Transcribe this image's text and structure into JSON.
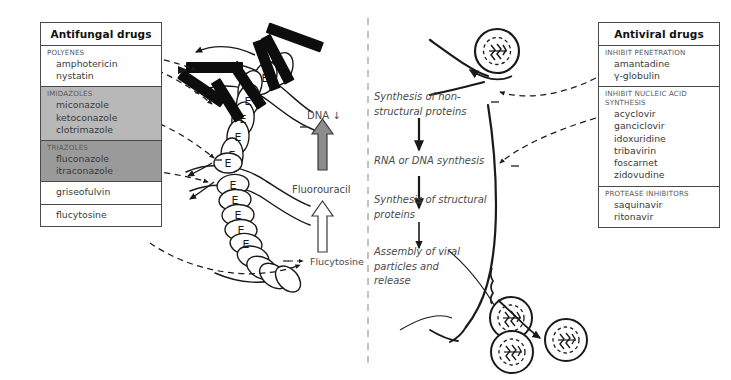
{
  "antifungal_panel": {
    "title": "Antifungal drugs",
    "groups": [
      {
        "heading": "POLYENES",
        "shade": "none",
        "drugs": [
          "amphotericin",
          "nystatin"
        ]
      },
      {
        "heading": "IMIDAZOLES",
        "shade": "light",
        "drugs": [
          "miconazole",
          "ketoconazole",
          "clotrimazole"
        ]
      },
      {
        "heading": "TRIAZOLES",
        "shade": "dark",
        "drugs": [
          "fluconazole",
          "itraconazole"
        ]
      },
      {
        "heading": "",
        "shade": "none",
        "drugs": [
          "griseofulvin"
        ]
      },
      {
        "heading": "",
        "shade": "none",
        "drugs": [
          "flucytosine"
        ]
      }
    ]
  },
  "antiviral_panel": {
    "title": "Antiviral drugs",
    "groups": [
      {
        "heading": "INHIBIT PENETRATION",
        "shade": "none",
        "drugs": [
          "amantadine",
          "γ-globulin"
        ]
      },
      {
        "heading": "INHIBIT NUCLEIC ACID\nSYNTHESIS",
        "shade": "none",
        "drugs": [
          "acyclovir",
          "ganciclovir",
          "idoxuridine",
          "tribavirin",
          "foscarnet",
          "zidovudine"
        ]
      },
      {
        "heading": "PROTEASE INHIBITORS",
        "shade": "none",
        "drugs": [
          "saquinavir",
          "ritonavir"
        ]
      }
    ]
  },
  "fungal_side": {
    "dna_label": "DNA ↓",
    "fluorouracil_label": "Fluorouracil",
    "flucytosine_label": "Flucytosine",
    "ergosterol_glyph": "E",
    "minus_sign": "−"
  },
  "viral_side": {
    "steps": [
      "Synthesis of non-structural proteins",
      "RNA or DNA synthesis",
      "Synthesis of structural proteins",
      "Assembly of viral particles and release"
    ],
    "step_nonstructural": "Synthesis of non-\nstructural proteins",
    "step_rna": "RNA or DNA synthesis",
    "step_structural": "Synthesis of structural\nproteins",
    "step_assembly": "Assembly of viral\nparticles and\nrelease",
    "minus_sign": "−"
  },
  "colors": {
    "ink": "#1a1a1a",
    "text_grey": "#4a4a4a",
    "heading_grey": "#5a5a5a",
    "panel_border": "#4a4a4a",
    "shade_light": "#b8b8b8",
    "shade_dark": "#9a9a9a",
    "arrow_fill_grey": "#8c8c8c",
    "background": "#ffffff"
  }
}
